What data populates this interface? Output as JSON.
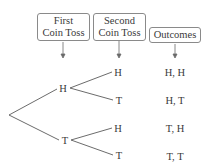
{
  "headers": [
    {
      "line1": "First",
      "line2": "Coin Toss"
    },
    {
      "line1": "Second",
      "line2": "Coin Toss"
    },
    {
      "label": "Outcomes"
    }
  ],
  "tree": {
    "first_toss": [
      "H",
      "T"
    ],
    "second_toss": [
      "H",
      "T",
      "H",
      "T"
    ]
  },
  "outcomes": [
    "H, H",
    "H, T",
    "T, H",
    "T, T"
  ],
  "colors": {
    "line": "#5a5a5a",
    "box_border": "#8a8a8a",
    "text": "#3a3a3a"
  }
}
